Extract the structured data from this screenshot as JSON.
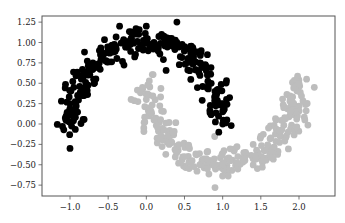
{
  "chart_data": {
    "type": "scatter",
    "title": "",
    "xlabel": "",
    "ylabel": "",
    "xlim": [
      -1.25,
      2.35
    ],
    "ylim": [
      -0.88,
      1.33
    ],
    "grid": false,
    "legend": null,
    "x_ticks": [
      -1.0,
      -0.5,
      0.0,
      0.5,
      1.0,
      1.5,
      2.0
    ],
    "x_tick_labels": [
      "−1.0",
      "−0.5",
      "0.0",
      "0.5",
      "1.0",
      "1.5",
      "2.0"
    ],
    "y_ticks": [
      1.25,
      1.0,
      0.75,
      0.5,
      0.25,
      0.0,
      -0.25,
      -0.5,
      -0.75
    ],
    "y_tick_labels": [
      "1.25",
      "1.00",
      "0.75",
      "0.50",
      "0.25",
      "0.00",
      "−0.25",
      "−0.50",
      "−0.75"
    ],
    "series": [
      {
        "name": "cluster 0 (upper moon)",
        "color": "#000000",
        "shape": "upper-half-circle, center (0,0), radius 1, noise ~0.1",
        "points": [
          [
            -1.05,
            0.1
          ],
          [
            -1.0,
            0.25
          ],
          [
            -0.95,
            0.45
          ],
          [
            -0.9,
            0.35
          ],
          [
            -0.85,
            0.55
          ],
          [
            -0.8,
            0.6
          ],
          [
            -0.75,
            0.7
          ],
          [
            -0.7,
            0.75
          ],
          [
            -0.6,
            0.85
          ],
          [
            -0.5,
            0.9
          ],
          [
            -0.4,
            0.95
          ],
          [
            -0.3,
            1.0
          ],
          [
            -0.2,
            1.05
          ],
          [
            -0.1,
            1.1
          ],
          [
            0.0,
            1.05
          ],
          [
            0.1,
            1.0
          ],
          [
            0.2,
            1.1
          ],
          [
            0.3,
            1.05
          ],
          [
            0.4,
            1.0
          ],
          [
            0.5,
            0.95
          ],
          [
            0.6,
            0.85
          ],
          [
            0.7,
            0.75
          ],
          [
            0.8,
            0.6
          ],
          [
            0.85,
            0.5
          ],
          [
            0.9,
            0.4
          ],
          [
            0.95,
            0.25
          ],
          [
            1.0,
            0.15
          ],
          [
            1.0,
            0.0
          ],
          [
            0.95,
            -0.1
          ],
          [
            -1.0,
            -0.3
          ],
          [
            0.4,
            1.25
          ],
          [
            0.0,
            1.2
          ],
          [
            -0.35,
            1.2
          ],
          [
            0.8,
            0.85
          ],
          [
            1.05,
            0.3
          ]
        ]
      },
      {
        "name": "cluster 1 (lower moon)",
        "color": "#bdbdbd",
        "shape": "lower-half-circle, center (1,0.5), radius 1, noise ~0.1",
        "points": [
          [
            -0.05,
            0.45
          ],
          [
            0.0,
            0.3
          ],
          [
            0.05,
            0.2
          ],
          [
            0.1,
            0.05
          ],
          [
            0.15,
            -0.05
          ],
          [
            0.2,
            -0.15
          ],
          [
            0.3,
            -0.25
          ],
          [
            0.4,
            -0.35
          ],
          [
            0.5,
            -0.4
          ],
          [
            0.6,
            -0.45
          ],
          [
            0.7,
            -0.5
          ],
          [
            0.8,
            -0.55
          ],
          [
            0.9,
            -0.5
          ],
          [
            1.0,
            -0.5
          ],
          [
            1.1,
            -0.45
          ],
          [
            1.2,
            -0.4
          ],
          [
            1.3,
            -0.35
          ],
          [
            1.4,
            -0.25
          ],
          [
            1.5,
            -0.15
          ],
          [
            1.6,
            -0.05
          ],
          [
            1.7,
            0.05
          ],
          [
            1.8,
            0.2
          ],
          [
            1.9,
            0.3
          ],
          [
            1.95,
            0.45
          ],
          [
            2.0,
            0.5
          ],
          [
            2.1,
            0.55
          ],
          [
            2.2,
            0.45
          ],
          [
            0.9,
            -0.78
          ],
          [
            -0.2,
            0.3
          ],
          [
            0.35,
            -0.1
          ]
        ]
      }
    ]
  }
}
